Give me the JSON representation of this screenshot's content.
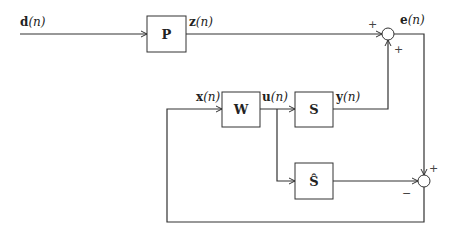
{
  "diagram": {
    "type": "block-diagram",
    "colors": {
      "line": "#333333",
      "box_fill": "#ffffff",
      "background": "#ffffff"
    },
    "blocks": [
      {
        "id": "P",
        "label": "P"
      },
      {
        "id": "W",
        "label": "W"
      },
      {
        "id": "S",
        "label": "S"
      },
      {
        "id": "S_hat",
        "label": "Ŝ"
      }
    ],
    "signals": {
      "d": {
        "name": "d",
        "arg": "(n)"
      },
      "z": {
        "name": "z",
        "arg": "(n)"
      },
      "e": {
        "name": "e",
        "arg": "(n)"
      },
      "x": {
        "name": "x",
        "arg": "(n)"
      },
      "u": {
        "name": "u",
        "arg": "(n)"
      },
      "y": {
        "name": "y",
        "arg": "(n)"
      }
    },
    "summing_junctions": [
      {
        "id": "sum_top",
        "signs": {
          "left": "+",
          "bottom": "+"
        }
      },
      {
        "id": "sum_bottom",
        "signs": {
          "top": "+",
          "left": "−"
        }
      }
    ]
  }
}
